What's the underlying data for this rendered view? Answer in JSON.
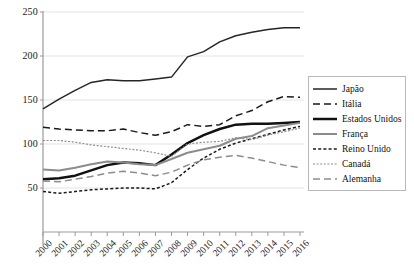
{
  "chart_data": {
    "type": "line",
    "title": "",
    "subtitle": "",
    "xlabel": "",
    "ylabel": "",
    "xlim": [
      2000,
      2016
    ],
    "ylim": [
      0,
      250
    ],
    "yticks": [
      50,
      100,
      150,
      200,
      250
    ],
    "grid": "horizontal",
    "legend_position": "right",
    "categories": [
      "2000",
      "2001",
      "2002",
      "2003",
      "2004",
      "2005",
      "2006",
      "2007",
      "2008",
      "2009",
      "2010",
      "2011",
      "2012",
      "2013",
      "2014",
      "2015",
      "2016"
    ],
    "x": [
      2000,
      2001,
      2002,
      2003,
      2004,
      2005,
      2006,
      2007,
      2008,
      2009,
      2010,
      2011,
      2012,
      2013,
      2014,
      2015,
      2016
    ],
    "series": [
      {
        "name": "Japão",
        "color": "#262626",
        "style": "solid",
        "width": 1.5,
        "values": [
          140,
          151,
          161,
          170,
          173,
          172,
          172,
          174,
          176,
          199,
          205,
          216,
          223,
          227,
          230,
          232,
          232
        ]
      },
      {
        "name": "Itália",
        "color": "#1a1a1a",
        "style": "dashed",
        "width": 1.5,
        "values": [
          119,
          117,
          116,
          115,
          115,
          117,
          113,
          110,
          114,
          122,
          120,
          122,
          132,
          138,
          148,
          154,
          153
        ]
      },
      {
        "name": "Estados Unidos",
        "color": "#111111",
        "style": "solid",
        "width": 2.5,
        "values": [
          60,
          61,
          64,
          70,
          76,
          79,
          78,
          76,
          88,
          101,
          110,
          117,
          122,
          123,
          123,
          124,
          125
        ]
      },
      {
        "name": "França",
        "color": "#8c8c8c",
        "style": "solid",
        "width": 2,
        "values": [
          71,
          70,
          73,
          77,
          80,
          79,
          77,
          76,
          83,
          90,
          94,
          98,
          106,
          109,
          118,
          121,
          124
        ]
      },
      {
        "name": "Reino Unido",
        "color": "#1a1a1a",
        "style": "dotted",
        "width": 1.5,
        "values": [
          46,
          44,
          46,
          48,
          49,
          50,
          50,
          49,
          56,
          71,
          84,
          94,
          101,
          106,
          111,
          116,
          120
        ]
      },
      {
        "name": "Canadá",
        "color": "#8c8c8c",
        "style": "finedot",
        "width": 1.2,
        "values": [
          104,
          104,
          102,
          99,
          97,
          95,
          93,
          90,
          86,
          100,
          102,
          103,
          107,
          105,
          110,
          114,
          118
        ]
      },
      {
        "name": "Alemanha",
        "color": "#8c8c8c",
        "style": "dashed",
        "width": 1.5,
        "values": [
          58,
          57,
          60,
          63,
          67,
          69,
          67,
          64,
          68,
          76,
          82,
          85,
          87,
          84,
          80,
          76,
          73
        ]
      }
    ]
  }
}
